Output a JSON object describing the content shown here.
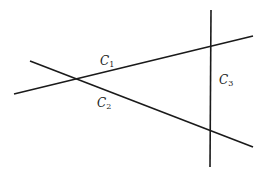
{
  "diagram": {
    "title": "",
    "lines": [
      {
        "id": "C1",
        "label": "C",
        "subscript": "1",
        "x1": 14,
        "y1": 94,
        "x2": 253,
        "y2": 36
      },
      {
        "id": "C2",
        "label": "C",
        "subscript": "2",
        "x1": 30,
        "y1": 61,
        "x2": 253,
        "y2": 147
      },
      {
        "id": "C3",
        "label": "C",
        "subscript": "3",
        "x1": 211,
        "y1": 10,
        "x2": 210,
        "y2": 167
      }
    ],
    "stroke_color": "#1a1a1a"
  }
}
